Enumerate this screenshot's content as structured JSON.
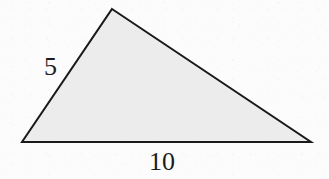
{
  "figure": {
    "kind": "triangle-diagram",
    "canvas": {
      "width": 329,
      "height": 179,
      "background_color": "#fcfcfc"
    },
    "shape": {
      "name": "triangle",
      "fill_color": "#ececec",
      "stroke_color": "#1a1a1a",
      "stroke_width": 2,
      "points": "112,9 311,142 22,142",
      "vertices": [
        {
          "name": "apex",
          "x": 112,
          "y": 9
        },
        {
          "name": "bottom-right",
          "x": 311,
          "y": 142
        },
        {
          "name": "bottom-left",
          "x": 22,
          "y": 142
        }
      ]
    },
    "labels": [
      {
        "id": "side-5",
        "text": "5",
        "side": "left",
        "x": 53,
        "y": 66
      },
      {
        "id": "side-10",
        "text": "10",
        "side": "base",
        "x": 164,
        "y": 161
      }
    ]
  },
  "chart_data": {
    "type": "diagram",
    "title": "",
    "shape": "triangle",
    "labeled_sides": [
      {
        "side": "left",
        "length": 5,
        "label": "5"
      },
      {
        "side": "base",
        "length": 10,
        "label": "10"
      }
    ],
    "unlabeled_sides": [
      {
        "side": "hypotenuse",
        "label": ""
      }
    ],
    "vertices_px": [
      [
        112,
        9
      ],
      [
        311,
        142
      ],
      [
        22,
        142
      ]
    ],
    "fill": "#ececec",
    "stroke": "#1a1a1a"
  }
}
